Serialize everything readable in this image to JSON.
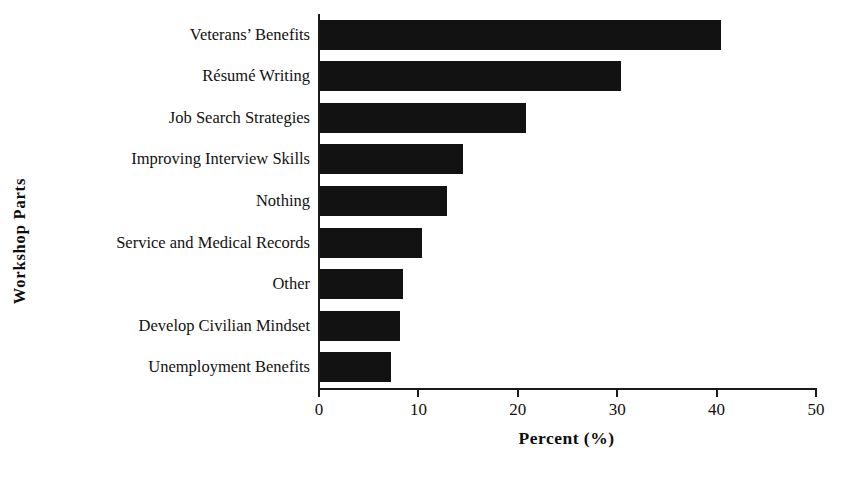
{
  "chart_data": {
    "type": "bar",
    "orientation": "horizontal",
    "title": "",
    "xlabel": "Percent (%)",
    "ylabel": "Workshop Parts",
    "categories": [
      "Veterans’ Benefits",
      "Résumé Writing",
      "Job Search Strategies",
      "Improving Interview Skills",
      "Nothing",
      "Service and Medical Records",
      "Other",
      "Develop Civilian Mindset",
      "Unemployment Benefits"
    ],
    "values": [
      40.3,
      30.3,
      20.7,
      14.4,
      12.8,
      10.3,
      8.4,
      8.0,
      7.1
    ],
    "xlim": [
      0,
      50
    ],
    "xticks": [
      0,
      10,
      20,
      30,
      40,
      50
    ],
    "xtick_labels": [
      "0",
      "10",
      "20",
      "30",
      "40",
      "50"
    ],
    "grid": false,
    "legend": false,
    "bar_color": "#121212",
    "axis_color": "#1a1a1a",
    "background": "#ffffff"
  }
}
